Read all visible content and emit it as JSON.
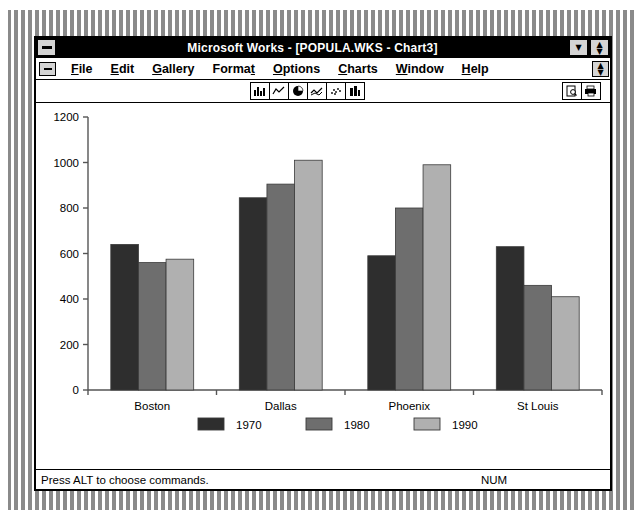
{
  "window": {
    "title": "Microsoft Works - [POPULA.WKS - Chart3]",
    "system_menu_icon": "system-menu-icon",
    "minimize_icon": "minimize-icon",
    "restore_icon": "restore-icon"
  },
  "menu": {
    "document_system_icon": "document-system-menu-icon",
    "document_restore_icon": "document-restore-icon",
    "items": [
      {
        "label": "File",
        "accel": "F"
      },
      {
        "label": "Edit",
        "accel": "E"
      },
      {
        "label": "Gallery",
        "accel": "G"
      },
      {
        "label": "Format",
        "accel": "t"
      },
      {
        "label": "Options",
        "accel": "O"
      },
      {
        "label": "Charts",
        "accel": "C"
      },
      {
        "label": "Window",
        "accel": "W"
      },
      {
        "label": "Help",
        "accel": "H"
      }
    ]
  },
  "toolbar": {
    "chart_buttons": [
      {
        "name": "bar-chart-icon"
      },
      {
        "name": "line-chart-icon"
      },
      {
        "name": "pie-chart-icon"
      },
      {
        "name": "area-chart-icon"
      },
      {
        "name": "scatter-chart-icon"
      },
      {
        "name": "stacked-bar-chart-icon"
      }
    ],
    "right_buttons": [
      {
        "name": "print-preview-icon"
      },
      {
        "name": "print-icon"
      }
    ]
  },
  "status": {
    "message": "Press ALT to choose commands.",
    "indicator": "NUM"
  },
  "colors": {
    "series_1970": "#2e2e2e",
    "series_1980": "#6e6e6e",
    "series_1990": "#b0b0b0",
    "axis": "#555555",
    "title_bar": "#000000",
    "window_bg": "#ffffff"
  },
  "chart_data": {
    "type": "bar",
    "title": "",
    "xlabel": "",
    "ylabel": "",
    "categories": [
      "Boston",
      "Dallas",
      "Phoenix",
      "St Louis"
    ],
    "series": [
      {
        "name": "1970",
        "color": "#2e2e2e",
        "values": [
          640,
          845,
          590,
          630
        ]
      },
      {
        "name": "1980",
        "color": "#6e6e6e",
        "values": [
          560,
          905,
          800,
          460
        ]
      },
      {
        "name": "1990",
        "color": "#b0b0b0",
        "values": [
          575,
          1010,
          990,
          410
        ]
      }
    ],
    "ylim": [
      0,
      1200
    ],
    "yticks": [
      0,
      200,
      400,
      600,
      800,
      1000,
      1200
    ],
    "ytick_labels": [
      "0",
      "200",
      "400",
      "600",
      "800",
      "1000",
      "1200"
    ],
    "grid": false,
    "legend_position": "bottom",
    "legend_entries": [
      "1970",
      "1980",
      "1990"
    ]
  }
}
